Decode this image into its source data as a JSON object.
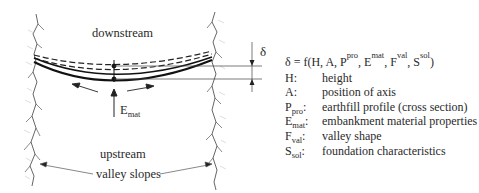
{
  "figure": {
    "labels": {
      "downstream": "downstream",
      "upstream": "upstream",
      "valley_slopes": "valley slopes",
      "delta": "δ",
      "e_main": "E",
      "e_sub": "mat"
    },
    "formula": {
      "lhs": "δ = f(H, A, P",
      "p_sub": "pro",
      "e": ", E",
      "e_sub": "mat",
      "f": ", F",
      "f_sub": "val",
      "s": ", S",
      "s_sub": "sol",
      "close": ")"
    },
    "legend": [
      {
        "symbol": "H",
        "sub": "",
        "colon": ":",
        "description": "height"
      },
      {
        "symbol": "A",
        "sub": "",
        "colon": ":",
        "description": "position of axis"
      },
      {
        "symbol": "P",
        "sub": "pro",
        "colon": ":",
        "description": "earthfill profile (cross section)"
      },
      {
        "symbol": "E",
        "sub": "mat",
        "colon": ":",
        "description": "embankment material properties"
      },
      {
        "symbol": "F",
        "sub": "val",
        "colon": ":",
        "description": "valley shape"
      },
      {
        "symbol": "S",
        "sub": "sol",
        "colon": ":",
        "description": "foundation characteristics"
      }
    ]
  }
}
